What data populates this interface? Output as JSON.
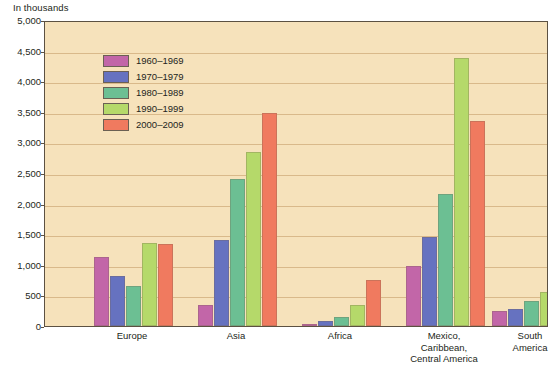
{
  "unit_label": "In thousands",
  "legend": {
    "entries": [
      {
        "label": "1960–1969",
        "color": "#c266a8"
      },
      {
        "label": "1970–1979",
        "color": "#6672c0"
      },
      {
        "label": "1980–1989",
        "color": "#6cbf93"
      },
      {
        "label": "1990–1999",
        "color": "#b5d96a"
      },
      {
        "label": "2000–2009",
        "color": "#f07a5f"
      }
    ]
  },
  "axis": {
    "y_ticks": [
      "0",
      "500",
      "1,000",
      "1,500",
      "2,000",
      "2,500",
      "3,000",
      "3,500",
      "4,000",
      "4,500",
      "5,000"
    ],
    "x_labels": [
      "Europe",
      "Asia",
      "Africa",
      "Mexico,\nCaribbean,\nCentral America",
      "South\nAmerica"
    ]
  },
  "chart_data": {
    "type": "bar",
    "title": "",
    "xlabel": "",
    "ylabel": "In thousands",
    "ylim": [
      0,
      5000
    ],
    "ytick_step": 500,
    "grid": true,
    "legend_position": "top-left-inside",
    "categories": [
      "Europe",
      "Asia",
      "Africa",
      "Mexico, Caribbean, Central America",
      "South America"
    ],
    "series": [
      {
        "name": "1960–1969",
        "color": "#c266a8",
        "values": [
          1130,
          350,
          30,
          980,
          250
        ]
      },
      {
        "name": "1970–1979",
        "color": "#6672c0",
        "values": [
          820,
          1400,
          80,
          1450,
          280
        ]
      },
      {
        "name": "1980–1989",
        "color": "#6cbf93",
        "values": [
          650,
          2400,
          140,
          2150,
          410
        ]
      },
      {
        "name": "1990–1999",
        "color": "#b5d96a",
        "values": [
          1350,
          2850,
          350,
          4380,
          560
        ]
      },
      {
        "name": "2000–2009",
        "color": "#f07a5f",
        "values": [
          1340,
          3480,
          760,
          3350,
          850
        ]
      }
    ]
  }
}
